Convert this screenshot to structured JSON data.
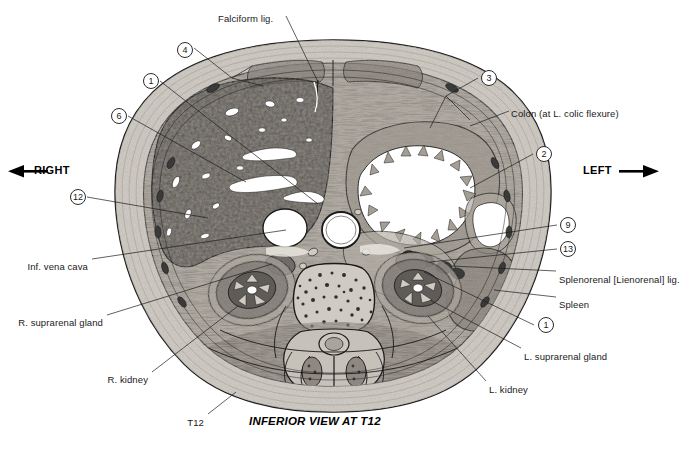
{
  "figure": {
    "caption": "INFERIOR VIEW AT T12",
    "orientation": {
      "left_marker": "RIGHT",
      "right_marker": "LEFT",
      "left_arrow_icon": "arrow-left-icon",
      "right_arrow_icon": "arrow-right-icon"
    }
  },
  "text_labels": [
    {
      "id": "falciform",
      "text": "Falciform lig.",
      "x": 218,
      "y": 14,
      "align": "left"
    },
    {
      "id": "colon",
      "text": "Colon (at L. colic flexure)",
      "x": 511,
      "y": 109,
      "align": "left"
    },
    {
      "id": "splenorenal",
      "text": "Splenorenal [Lienorenal] lig.",
      "x": 559,
      "y": 275,
      "align": "left"
    },
    {
      "id": "spleen",
      "text": "Spleen",
      "x": 559,
      "y": 300,
      "align": "left"
    },
    {
      "id": "l-suprarenal",
      "text": "L. suprarenal gland",
      "x": 524,
      "y": 352,
      "align": "left"
    },
    {
      "id": "l-kidney",
      "text": "L. kidney",
      "x": 489,
      "y": 385,
      "align": "left"
    },
    {
      "id": "ivc",
      "text": "Inf. vena cava",
      "x": 88,
      "y": 262,
      "align": "right"
    },
    {
      "id": "r-suprarenal",
      "text": "R. suprarenal gland",
      "x": 103,
      "y": 318,
      "align": "right"
    },
    {
      "id": "r-kidney",
      "text": "R. kidney",
      "x": 148,
      "y": 375,
      "align": "right"
    },
    {
      "id": "t12",
      "text": "T12",
      "x": 204,
      "y": 418,
      "align": "right"
    }
  ],
  "numbered_callouts": [
    {
      "n": "4",
      "x": 177,
      "y": 42
    },
    {
      "n": "1",
      "x": 143,
      "y": 73
    },
    {
      "n": "6",
      "x": 111,
      "y": 108
    },
    {
      "n": "12",
      "x": 70,
      "y": 189
    },
    {
      "n": "3",
      "x": 481,
      "y": 70
    },
    {
      "n": "2",
      "x": 536,
      "y": 146
    },
    {
      "n": "9",
      "x": 560,
      "y": 217
    },
    {
      "n": "13",
      "x": 560,
      "y": 241
    },
    {
      "n": "1",
      "x": 538,
      "y": 317
    }
  ],
  "colors": {
    "ink": "#1a1a1a",
    "paper": "#ffffff",
    "skin": "#d6d2cc",
    "fat": "#b9b4ac",
    "muscle": "#8e8880",
    "liver": "#6e6a66",
    "vessel": "#ffffff",
    "bone": "#cfcac2",
    "kidney": "#7a7570"
  }
}
